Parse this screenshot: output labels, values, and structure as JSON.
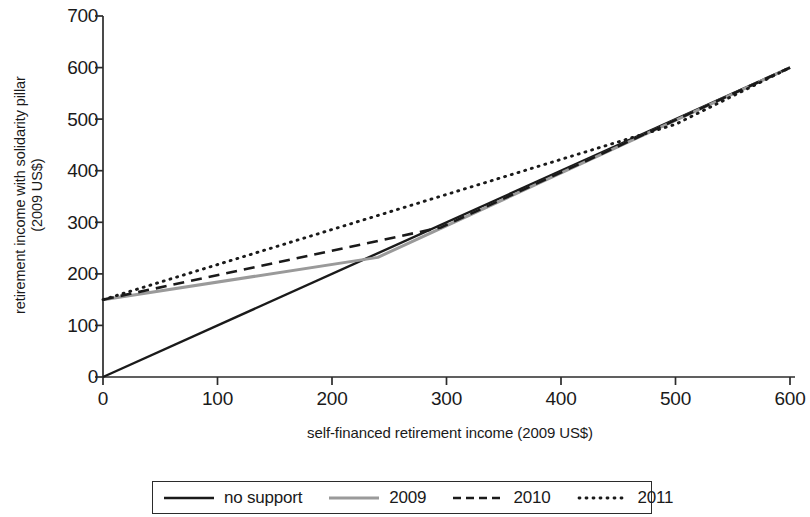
{
  "chart_data": {
    "type": "line",
    "title": "",
    "xlabel": "self-financed retirement income (2009 US$)",
    "ylabel_line1": "retirement income with solidarity pillar",
    "ylabel_line2": "(2009 US$)",
    "xlim": [
      0,
      600
    ],
    "ylim": [
      0,
      700
    ],
    "xticks": [
      0,
      100,
      200,
      300,
      400,
      500,
      600
    ],
    "yticks": [
      0,
      100,
      200,
      300,
      400,
      500,
      600,
      700
    ],
    "grid": false,
    "legend_position": "bottom",
    "series": [
      {
        "name": "no support",
        "style": "solid",
        "color": "#1a1a1a",
        "x": [
          0,
          600
        ],
        "y": [
          0,
          600
        ]
      },
      {
        "name": "2009",
        "style": "solid",
        "color": "#9a9a9a",
        "x": [
          0,
          240,
          600
        ],
        "y": [
          150,
          232,
          600
        ]
      },
      {
        "name": "2010",
        "style": "dashed",
        "color": "#1a1a1a",
        "x": [
          0,
          295,
          600
        ],
        "y": [
          150,
          290,
          600
        ]
      },
      {
        "name": "2011",
        "style": "dotted",
        "color": "#1a1a1a",
        "x": [
          0,
          500,
          600
        ],
        "y": [
          150,
          490,
          600
        ]
      }
    ]
  },
  "axes": {
    "y_tick_labels": [
      "700",
      "600",
      "500",
      "400",
      "300",
      "200",
      "100",
      "0"
    ],
    "x_tick_labels": [
      "0",
      "100",
      "200",
      "300",
      "400",
      "500",
      "600"
    ],
    "x_axis_title": "self-financed retirement income (2009 US$)",
    "y_axis_title_line1": "retirement income with solidarity pillar",
    "y_axis_title_line2": "(2009 US$)"
  },
  "legend": {
    "items": [
      {
        "label": "no support",
        "style": "solid",
        "color": "#1a1a1a"
      },
      {
        "label": "2009",
        "style": "solid",
        "color": "#9a9a9a"
      },
      {
        "label": "2010",
        "style": "dashed",
        "color": "#1a1a1a"
      },
      {
        "label": "2011",
        "style": "dotted",
        "color": "#1a1a1a"
      }
    ]
  },
  "colors": {
    "axis": "#2b2b2b",
    "background": "#ffffff",
    "series_black": "#1a1a1a",
    "series_gray": "#9a9a9a"
  }
}
